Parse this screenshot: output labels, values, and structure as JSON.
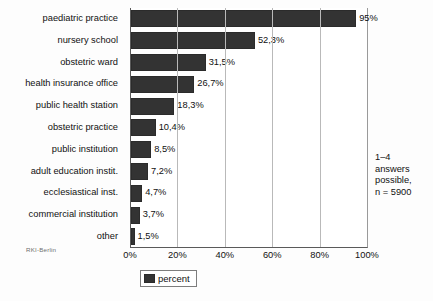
{
  "chart_data": {
    "type": "bar",
    "orientation": "horizontal",
    "title": "",
    "xlabel": "",
    "ylabel": "",
    "xlim": [
      0,
      100
    ],
    "grid": true,
    "legend_position": "bottom-left",
    "categories": [
      "paediatric practice",
      "nursery school",
      "obstetric ward",
      "health insurance office",
      "public health station",
      "obstetric practice",
      "public institution",
      "adult education instit.",
      "ecclesiastical inst.",
      "commercial institution",
      "other"
    ],
    "values": [
      95,
      52.3,
      31.5,
      26.7,
      18.3,
      10.4,
      8.5,
      7.2,
      4.7,
      3.7,
      1.5
    ],
    "value_labels": [
      "95%",
      "52,3%",
      "31,5%",
      "26,7%",
      "18,3%",
      "10,4%",
      "8,5%",
      "7,2%",
      "4,7%",
      "3,7%",
      "1,5%"
    ],
    "xticks": [
      0,
      20,
      40,
      60,
      80,
      100
    ],
    "xtick_labels": [
      "0%",
      "20%",
      "40%",
      "60%",
      "80%",
      "100%"
    ],
    "series": [
      {
        "name": "percent",
        "color": "#333333",
        "values": [
          95,
          52.3,
          31.5,
          26.7,
          18.3,
          10.4,
          8.5,
          7.2,
          4.7,
          3.7,
          1.5
        ]
      }
    ],
    "annotations": [
      "1–4",
      "answers",
      "possible,",
      "n = 5900"
    ],
    "source_note": "RKI-Berlin"
  },
  "legend": {
    "label": "percent"
  },
  "annotation": {
    "line1": "1–4",
    "line2": "answers",
    "line3": "possible,",
    "line4": "n = 5900"
  },
  "source": {
    "text": "RKI-Berlin"
  }
}
